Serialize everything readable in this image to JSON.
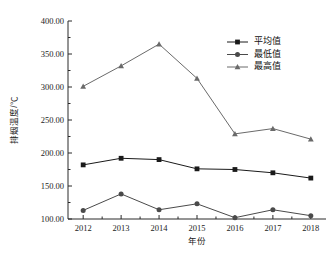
{
  "chart_data": {
    "type": "line",
    "title": "",
    "xlabel": "年份",
    "ylabel": "排烟温度/℃",
    "categories": [
      "2012",
      "2013",
      "2014",
      "2015",
      "2016",
      "2017",
      "2018"
    ],
    "x": [
      2012,
      2013,
      2014,
      2015,
      2016,
      2017,
      2018
    ],
    "xlim": [
      2011.6,
      2018.4
    ],
    "ylim": [
      100,
      400
    ],
    "ytick_values": [
      100,
      150,
      200,
      250,
      300,
      350,
      400
    ],
    "ytick_labels": [
      "100.00",
      "150.00",
      "200.00",
      "250.00",
      "300.00",
      "350.00",
      "400.00"
    ],
    "yminor_step": 25,
    "grid": false,
    "legend_position": "upper right",
    "series": [
      {
        "name": "平均值",
        "marker": "square",
        "color": "#1a1a1a",
        "values": [
          182,
          192,
          190,
          176,
          175,
          170,
          162
        ]
      },
      {
        "name": "最低值",
        "marker": "circle",
        "color": "#4a4a4a",
        "values": [
          113,
          138,
          114,
          123,
          102,
          114,
          105
        ]
      },
      {
        "name": "最高值",
        "marker": "triangle",
        "color": "#6a6a6a",
        "values": [
          301,
          332,
          365,
          313,
          229,
          237,
          221
        ]
      }
    ]
  },
  "top_strip": {
    "text": " "
  }
}
